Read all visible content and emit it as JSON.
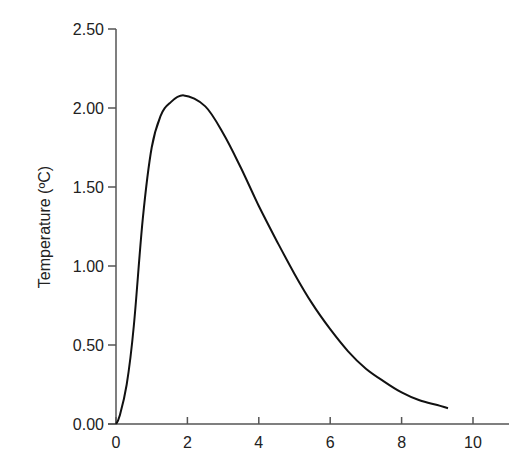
{
  "chart_data": {
    "type": "line",
    "title": "",
    "xlabel": "",
    "ylabel": "Temperature (ºC)",
    "xlim": [
      0,
      11
    ],
    "ylim": [
      0,
      2.5
    ],
    "grid": false,
    "legend": null,
    "x_ticks": [
      "0",
      "2",
      "4",
      "6",
      "8",
      "10"
    ],
    "y_ticks": [
      "0.00",
      "0.50",
      "1.00",
      "1.50",
      "2.00",
      "2.50"
    ],
    "series": [
      {
        "name": "Temperature",
        "color": "#111111",
        "x": [
          0,
          0.1,
          0.3,
          0.5,
          0.75,
          1.0,
          1.25,
          1.5,
          1.9,
          2.5,
          3.0,
          3.5,
          4.0,
          4.5,
          5.0,
          5.5,
          6.0,
          6.5,
          7.0,
          7.5,
          8.0,
          8.5,
          9.0,
          9.3
        ],
        "values": [
          0.0,
          0.05,
          0.25,
          0.62,
          1.3,
          1.75,
          1.95,
          2.03,
          2.08,
          2.01,
          1.84,
          1.62,
          1.38,
          1.16,
          0.95,
          0.76,
          0.6,
          0.46,
          0.35,
          0.27,
          0.2,
          0.15,
          0.12,
          0.1
        ]
      }
    ]
  }
}
